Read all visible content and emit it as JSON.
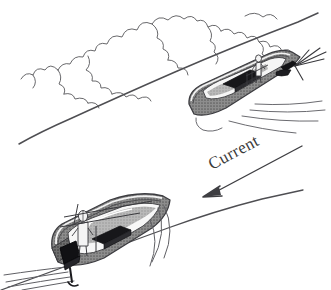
{
  "figure": {
    "type": "line-drawing",
    "background_color": "#ffffff",
    "ink_color": "#4a4a4a",
    "hull_shade_color": "#7a7a7a",
    "dark_object_color": "#1a1a1a"
  },
  "annotations": {
    "current_label": "Current"
  },
  "elements": {
    "treeline_name": "treeline-cloud-outline",
    "upper_bank_name": "upper-riverbank-line",
    "lower_bank_name": "lower-riverbank-line",
    "current_arrow_name": "current-arrow",
    "upper_boat_name": "upper-boat",
    "lower_boat_name": "lower-boat"
  },
  "upper_boat": {
    "label": "Boat heading upstream, bow toward lower left",
    "person": "standing-figure",
    "seat": "dark-seat-block",
    "motor": "dark-outboard-motor",
    "wake": "wake-lines"
  },
  "lower_boat": {
    "label": "Boat viewed from stern quarter with outboard motor",
    "person": "standing-figure",
    "seat": "dark-seat-block",
    "motor": "dark-outboard-motor",
    "wake": "wake-lines"
  }
}
